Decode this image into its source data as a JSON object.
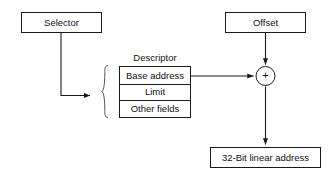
{
  "diagram": {
    "background_color": "#ffffff",
    "stroke_color": "#1a1a1a",
    "text_color": "#111111",
    "brace_color": "#555555",
    "nodes": {
      "selector": {
        "label": "Selector"
      },
      "offset": {
        "label": "Offset"
      },
      "descriptor_caption": {
        "label": "Descriptor"
      },
      "descriptor_rows": [
        {
          "label": "Base address"
        },
        {
          "label": "Limit"
        },
        {
          "label": "Other fields"
        }
      ],
      "adder": {
        "label": "+",
        "icon": "plus-icon"
      },
      "linear_address": {
        "label": "32-Bit linear address"
      }
    },
    "connections": [
      {
        "name": "selector-to-descriptor",
        "from": "selector",
        "to": "descriptor",
        "arrow": true
      },
      {
        "name": "offset-to-adder",
        "from": "offset",
        "to": "adder",
        "arrow": true
      },
      {
        "name": "base-address-to-adder",
        "from": "base address",
        "to": "adder",
        "arrow": true
      },
      {
        "name": "adder-to-linear-address",
        "from": "adder",
        "to": "32-Bit linear address",
        "arrow": true
      }
    ]
  }
}
